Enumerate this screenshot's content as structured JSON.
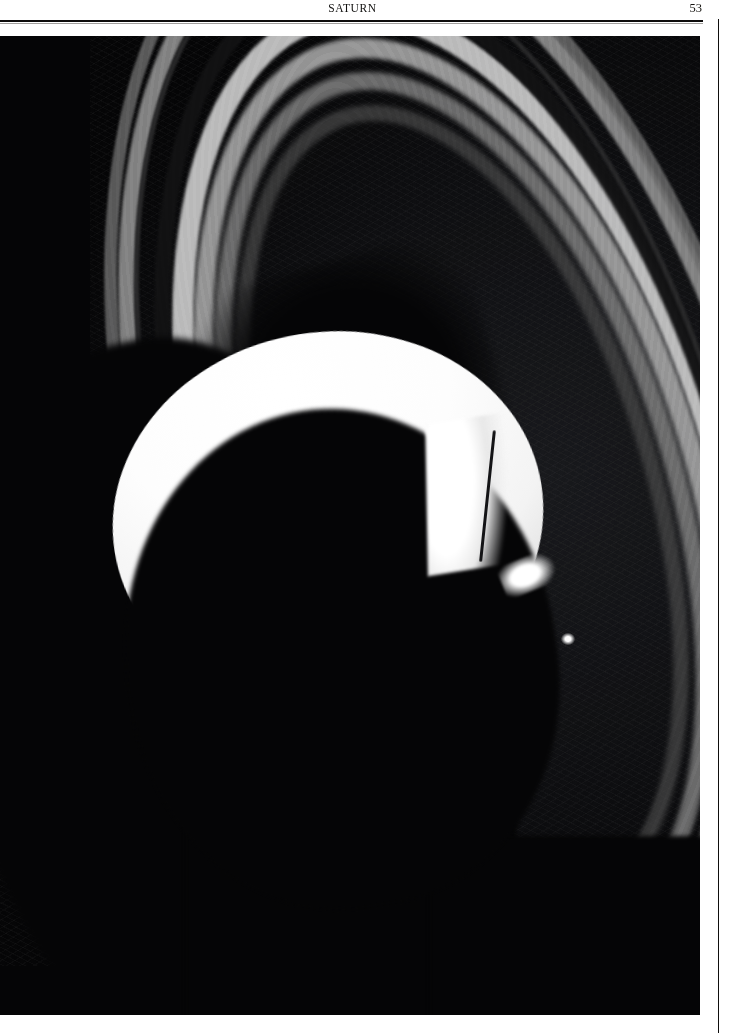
{
  "page": {
    "running_head": "SATURN",
    "folio": "53",
    "width_px": 731,
    "height_px": 1033,
    "background_color": "#ffffff",
    "rule_color": "#0d0c0b"
  },
  "plate": {
    "caption": "",
    "subject": "saturn-crescent-with-rings",
    "background_color": "#050506",
    "bleed": "full-width photographic plate below the running head",
    "elements": [
      {
        "name": "planet-crescent",
        "description": "Sunlit crescent of Saturn's northern hemisphere",
        "color": "#ffffff"
      },
      {
        "name": "planet-night-side",
        "description": "Unlit limb and shadowed southern portion of the globe",
        "color": "#050506"
      },
      {
        "name": "ring-a-outer",
        "description": "Outer A ring, dim grey",
        "color": "#6d6d6d"
      },
      {
        "name": "ring-a-inner",
        "description": "Inner A ring, brighter grey",
        "color": "#8e8e8e"
      },
      {
        "name": "encke-gap",
        "description": "Narrow dark division within the A ring",
        "color": "#2a2a2b"
      },
      {
        "name": "cassini-division",
        "description": "Broad dark gap between the A and B rings",
        "color": "#121213"
      },
      {
        "name": "ring-b-outer",
        "description": "Outer B ring, brightest band",
        "color": "#c9c9c9"
      },
      {
        "name": "ring-b-middle",
        "description": "Middle B ring",
        "color": "#a6a6a6"
      },
      {
        "name": "ring-b-inner",
        "description": "Inner B ring",
        "color": "#7e7e7e"
      },
      {
        "name": "ring-c",
        "description": "Faint inner C or crepe ring",
        "color": "#4a4a4a"
      },
      {
        "name": "planet-shadow-on-rings",
        "description": "Shadow of the globe cut across the rings at lower left",
        "color": "#050506"
      },
      {
        "name": "ring-shadow-on-planet",
        "description": "Thin dark ring line crossing the bright crescent",
        "color": "#141416"
      }
    ]
  }
}
